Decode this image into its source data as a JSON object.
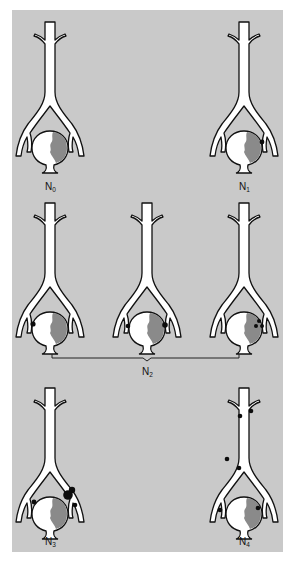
{
  "figure": {
    "colors": {
      "background": "#c9c9c9",
      "vessel": "#ffffff",
      "outline": "#111111",
      "tumor": "#8a8a8a",
      "lymph_node": "#0c0c0c"
    }
  },
  "panels": [
    {
      "id": "N0",
      "label_main": "N",
      "label_sub": "0",
      "cx": 50,
      "top": 22,
      "nodes": []
    },
    {
      "id": "N1",
      "label_main": "N",
      "label_sub": "1",
      "cx": 244,
      "top": 22,
      "nodes": [
        {
          "x": 262,
          "y": 142,
          "r": 2.4
        }
      ]
    },
    {
      "id": "N2a",
      "label_main": "",
      "label_sub": "",
      "cx": 50,
      "top": 203,
      "nodes": [
        {
          "x": 33,
          "y": 324,
          "r": 2.6
        }
      ]
    },
    {
      "id": "N2b",
      "label_main": "",
      "label_sub": "",
      "cx": 147,
      "top": 203,
      "nodes": [
        {
          "x": 128,
          "y": 326,
          "r": 2.3
        },
        {
          "x": 165,
          "y": 325,
          "r": 2.8
        }
      ]
    },
    {
      "id": "N2c",
      "label_main": "",
      "label_sub": "",
      "cx": 244,
      "top": 203,
      "nodes": [
        {
          "x": 259,
          "y": 321,
          "r": 2.0
        },
        {
          "x": 256,
          "y": 326,
          "r": 2.0
        },
        {
          "x": 262,
          "y": 326,
          "r": 2.0
        }
      ]
    },
    {
      "id": "N3",
      "label_main": "N",
      "label_sub": "3",
      "cx": 50,
      "top": 390,
      "nodes": [
        {
          "x": 34,
          "y": 502,
          "r": 2.4
        },
        {
          "x": 68,
          "y": 495,
          "r": 4.8
        },
        {
          "x": 72,
          "y": 490,
          "r": 3.2
        },
        {
          "x": 75,
          "y": 505,
          "r": 2.3
        }
      ]
    },
    {
      "id": "N4",
      "label_main": "N",
      "label_sub": "4",
      "cx": 244,
      "top": 390,
      "nodes": [
        {
          "x": 240,
          "y": 416,
          "r": 2.3
        },
        {
          "x": 251,
          "y": 411,
          "r": 2.3
        },
        {
          "x": 227,
          "y": 459,
          "r": 2.3
        },
        {
          "x": 239,
          "y": 468,
          "r": 2.3
        },
        {
          "x": 220,
          "y": 510,
          "r": 2.3
        },
        {
          "x": 258,
          "y": 508,
          "r": 2.3
        }
      ]
    }
  ],
  "group": {
    "label_main": "N",
    "label_sub": "2",
    "bracket": {
      "x1": 52,
      "x2": 239,
      "y": 358,
      "mid": 147
    }
  }
}
